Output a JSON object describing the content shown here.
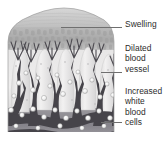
{
  "figure": {
    "background_color": "#ffffff",
    "text_color": "#2b2b2b",
    "leader_color": "#6f6f6f"
  },
  "labels": [
    {
      "id": "swelling",
      "text": "Swelling"
    },
    {
      "id": "dilated",
      "text": "Dilated\nblood\nvessel"
    },
    {
      "id": "increased",
      "text": "Increased\nwhite\nblood\ncells"
    }
  ],
  "illustration": {
    "name": "inflamed-tissue-cross-section",
    "description": "Grayscale cross-section of swollen skin tissue with dilated branching blood vessels and increased white blood cells",
    "palette": {
      "epidermis_light": "#d9d9d9",
      "epidermis_mid": "#c3c3c3",
      "swollen_band": "#b4b4b4",
      "dermis_light": "#eceaea",
      "vessel_dark": "#3d3b3e",
      "vessel_mid": "#5d5a5e",
      "deep_tissue": "#8d8b90",
      "white_cell": "#f3f3f3",
      "white_cell_ring": "#8a8a8a"
    }
  }
}
